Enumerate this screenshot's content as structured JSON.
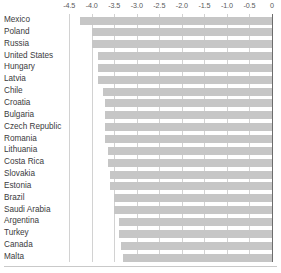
{
  "chart_data": {
    "type": "bar",
    "orientation": "horizontal",
    "title": "",
    "subtitle": "",
    "xlabel": "",
    "ylabel": "",
    "xlim": [
      -4.5,
      0
    ],
    "ylim": null,
    "grid": true,
    "legend": null,
    "legend_position": "none",
    "bar_color": "#c6c6c6",
    "axis_color": "#6d6d6d",
    "gridline_color": "#d2d2d2",
    "tick_labels": [
      "-4.5",
      "-4.0",
      "-3.5",
      "-3.0",
      "-2.5",
      "-2.0",
      "-1.5",
      "-1.0",
      "-0.5",
      "0"
    ],
    "tick_values": [
      -4.5,
      -4.0,
      -3.5,
      -3.0,
      -2.5,
      -2.0,
      -1.5,
      -1.0,
      -0.5,
      0
    ],
    "categories": [
      "Mexico",
      "Poland",
      "Russia",
      "United States",
      "Hungary",
      "Latvia",
      "Chile",
      "Croatia",
      "Bulgaria",
      "Czech Republic",
      "Romania",
      "Lithuania",
      "Costa Rica",
      "Slovakia",
      "Estonia",
      "Brazil",
      "Saudi Arabia",
      "Argentina",
      "Turkey",
      "Canada",
      "Malta"
    ],
    "values": [
      -4.25,
      -4.0,
      -4.0,
      -3.85,
      -3.85,
      -3.85,
      -3.75,
      -3.7,
      -3.7,
      -3.7,
      -3.7,
      -3.65,
      -3.65,
      -3.6,
      -3.6,
      -3.5,
      -3.5,
      -3.4,
      -3.4,
      -3.35,
      -3.3
    ]
  }
}
